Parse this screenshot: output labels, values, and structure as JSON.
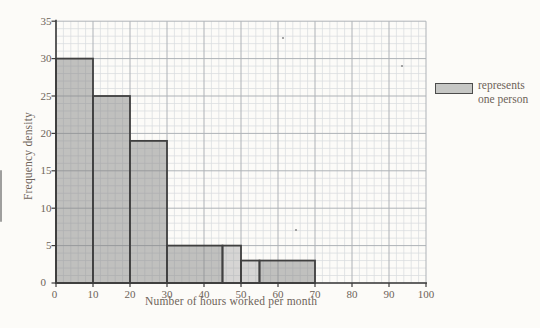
{
  "page": {
    "background": "#fcfbf8",
    "text_color": "#6e6359"
  },
  "chart_data": {
    "type": "bar",
    "variant": "histogram",
    "title": "",
    "xlabel": "Number of hours worked per month",
    "ylabel": "Frequency density",
    "xlim": [
      0,
      100
    ],
    "ylim": [
      0,
      35
    ],
    "x_ticks": [
      0,
      10,
      20,
      30,
      40,
      50,
      60,
      70,
      80,
      90,
      100
    ],
    "y_ticks": [
      0,
      5,
      10,
      15,
      20,
      25,
      30,
      35
    ],
    "grid": {
      "show": true,
      "x_minor_step": 2,
      "y_minor_step": 1,
      "x_major_step": 10,
      "y_major_step": 5,
      "minor_color": "#dadcdf",
      "major_color": "#aeb2b7"
    },
    "axis_color": "#3c3c3c",
    "text_color": "#6e6359",
    "bar_stroke": "#404040",
    "bars": [
      {
        "from": 0,
        "to": 10,
        "frequency_density": 30,
        "fill": "rgba(128,128,128,0.48)"
      },
      {
        "from": 10,
        "to": 20,
        "frequency_density": 25,
        "fill": "rgba(128,128,128,0.48)"
      },
      {
        "from": 20,
        "to": 30,
        "frequency_density": 19,
        "fill": "rgba(128,128,128,0.48)"
      },
      {
        "from": 30,
        "to": 45,
        "frequency_density": 5,
        "fill": "rgba(128,128,128,0.48)"
      },
      {
        "from": 45,
        "to": 50,
        "frequency_density": 5,
        "fill": "rgba(152,152,152,0.38)"
      },
      {
        "from": 50,
        "to": 55,
        "frequency_density": 3,
        "fill": "rgba(152,152,152,0.38)"
      },
      {
        "from": 55,
        "to": 70,
        "frequency_density": 3,
        "fill": "rgba(128,128,128,0.48)"
      }
    ],
    "legend": {
      "line1": "represents",
      "line2": "one person",
      "swatch_fill": "#c6c7c5",
      "swatch_stroke": "#4c4c4c",
      "position": "right"
    },
    "scan_specks": [
      {
        "x": 283,
        "y": 38
      },
      {
        "x": 402,
        "y": 66
      },
      {
        "x": 296,
        "y": 230
      }
    ]
  }
}
